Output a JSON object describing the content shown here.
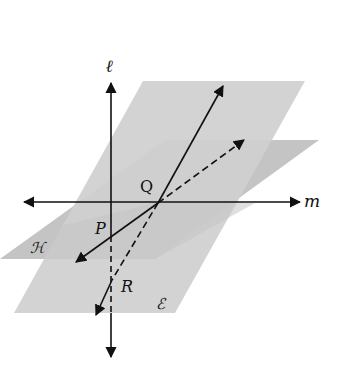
{
  "diagram": {
    "colors": {
      "plane_E": "#cfcfcf",
      "plane_H": "#c4c4c4",
      "line": "#111111",
      "background": "#ffffff"
    },
    "labels": {
      "line_l": "ℓ",
      "line_m": "m",
      "point_Q": "Q",
      "point_P": "P",
      "point_R": "R",
      "plane_H": "ℋ",
      "plane_E": "ℰ"
    }
  }
}
